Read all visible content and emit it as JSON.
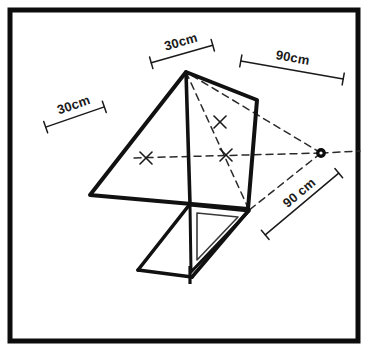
{
  "figure": {
    "type": "technical-line-drawing",
    "background_color": "#ffffff",
    "ink_color": "#111111",
    "border": {
      "color": "#0d0d0d",
      "inset_px": 8,
      "thickness_px": 5
    }
  },
  "dimension_labels": [
    {
      "id": "top-30cm",
      "text": "30cm",
      "x": 175,
      "y": 44,
      "rotation_deg": -16,
      "tick_start": [
        149,
        62
      ],
      "tick_end": [
        216,
        43
      ],
      "tick_rotation_deg": -16
    },
    {
      "id": "left-30cm",
      "text": "30cm",
      "x": 68,
      "y": 105,
      "rotation_deg": -19,
      "tick_start": [
        44,
        124
      ],
      "tick_end": [
        106,
        103
      ],
      "tick_rotation_deg": -19
    },
    {
      "id": "top-right-90cm",
      "text": "90cm",
      "x": 283,
      "y": 59,
      "rotation_deg": 9,
      "tick_start": [
        240,
        54
      ],
      "tick_end": [
        344,
        80
      ],
      "tick_rotation_deg": 9
    },
    {
      "id": "bottom-right-90cm",
      "text": "90 cm",
      "x": 299,
      "y": 209,
      "rotation_deg": -40,
      "tick_start": [
        263,
        232
      ],
      "tick_end": [
        341,
        176
      ],
      "tick_rotation_deg": -40
    }
  ],
  "geometry": {
    "vanishing_point": {
      "x": 321,
      "y": 153,
      "radius": 4
    },
    "sail_panel": {
      "name": "upper-sail-quadrilateral",
      "points": [
        [
          186,
          72
        ],
        [
          257,
          100
        ],
        [
          248,
          209
        ],
        [
          90,
          195
        ]
      ],
      "stroke_width": 4
    },
    "spine": {
      "name": "centre-spine",
      "from": [
        186,
        72
      ],
      "to": [
        190,
        203
      ],
      "stroke_width": 3.5
    },
    "keel_triangle_outer": {
      "name": "keel-triangle-outer",
      "points": [
        [
          190,
          205
        ],
        [
          248,
          211
        ],
        [
          191,
          273
        ]
      ],
      "stroke_width": 3
    },
    "keel_triangle_inner": {
      "name": "keel-triangle-inner",
      "points": [
        [
          196,
          212
        ],
        [
          238,
          216
        ],
        [
          196,
          262
        ]
      ],
      "stroke_width": 1.6
    },
    "tail_frame": {
      "name": "lower-tail-frame",
      "segments": [
        {
          "from": [
            190,
            203
          ],
          "to": [
            138,
            270
          ]
        },
        {
          "from": [
            138,
            270
          ],
          "to": [
            191,
            277
          ]
        },
        {
          "from": [
            191,
            277
          ],
          "to": [
            248,
            209
          ]
        }
      ],
      "stroke_width": 3.5
    },
    "spine_foot": {
      "name": "spine-foot-stub",
      "from": [
        190,
        268
      ],
      "to": [
        190,
        283
      ],
      "stroke_width": 3
    },
    "dashed_construction_lines": [
      {
        "id": "vp-to-left-mid",
        "from": [
          321,
          153
        ],
        "to": [
          131,
          158
        ]
      },
      {
        "id": "vp-to-apex",
        "from": [
          321,
          153
        ],
        "to": [
          186,
          72
        ]
      },
      {
        "id": "vp-to-keel-tip",
        "from": [
          321,
          153
        ],
        "to": [
          248,
          211
        ]
      },
      {
        "id": "vp-outward",
        "from": [
          321,
          153
        ],
        "to": [
          358,
          151
        ]
      },
      {
        "id": "apex-to-keel-corner",
        "from": [
          186,
          72
        ],
        "to": [
          248,
          209
        ]
      },
      {
        "id": "apex-to-bottom-left",
        "from": [
          186,
          72
        ],
        "to": [
          190,
          203
        ]
      }
    ],
    "cross_marks": [
      {
        "id": "cross-left-midpoint",
        "x": 146,
        "y": 158,
        "size": 7
      },
      {
        "id": "cross-upper-midpoint",
        "x": 220,
        "y": 122,
        "size": 7
      },
      {
        "id": "cross-panel-intersection",
        "x": 226,
        "y": 155,
        "size": 6
      }
    ]
  }
}
